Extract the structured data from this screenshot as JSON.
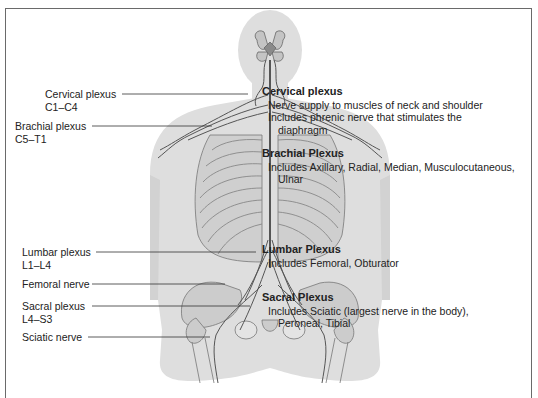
{
  "figure": {
    "colors": {
      "body": "#d9d9d9",
      "body_light": "#e6e6e6",
      "bone": "#c8c8c8",
      "nerve": "#555555",
      "frame": "#6a6a6a"
    }
  },
  "labels": [
    {
      "name": "Cervical plexus",
      "range": "C1–C4"
    },
    {
      "name": "Brachial plexus",
      "range": "C5–T1"
    },
    {
      "name": "Lumbar plexus",
      "range": "L1–L4"
    },
    {
      "name": "Femoral nerve",
      "range": ""
    },
    {
      "name": "Sacral plexus",
      "range": "L4–S3"
    },
    {
      "name": "Sciatic nerve",
      "range": ""
    }
  ],
  "descriptions": [
    {
      "heading": "Cervical plexus",
      "lines": [
        "Nerve supply to muscles of neck and shoulder",
        "Includes phrenic nerve that stimulates the",
        "diaphragm"
      ]
    },
    {
      "heading": "Brachial Plexus",
      "lines": [
        "Includes Axillary, Radial, Median, Musculocutaneous,",
        "Ulnar"
      ]
    },
    {
      "heading": "Lumbar Plexus",
      "lines": [
        "Includes Femoral, Obturator"
      ]
    },
    {
      "heading": "Sacral Plexus",
      "lines": [
        "Includes Sciatic (largest nerve in the body),",
        "Peroneal, Tibial"
      ]
    }
  ]
}
